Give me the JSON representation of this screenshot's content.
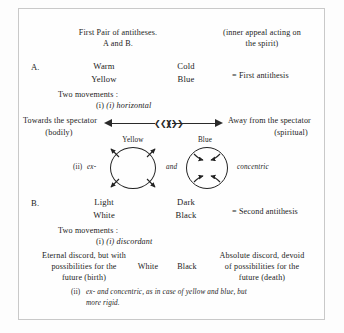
{
  "page": {
    "heading_line1": "First Pair of antitheses.",
    "heading_line2": "A and B.",
    "note_line1": "(inner appeal acting on",
    "note_line2": "the spirit)"
  },
  "section_a": {
    "label": "A.",
    "warm": "Warm",
    "yellow": "Yellow",
    "cold": "Cold",
    "blue": "Blue",
    "result": "= First antithesis",
    "two_movements": "Two movements :",
    "movement_i": "(i) horizontal",
    "towards_line1": "Towards the spectator",
    "towards_line2": "(bodily)",
    "away_line1": "Away from the spectator",
    "away_line2": "(spiritual)",
    "movement_ii_num": "(ii)",
    "movement_ii_ex": "ex-",
    "movement_ii_and": "and",
    "movement_ii_concentric": "concentric",
    "circle_left_label": "Yellow",
    "circle_right_label": "Blue"
  },
  "section_b": {
    "label": "B.",
    "light": "Light",
    "white": "White",
    "dark": "Dark",
    "black": "Black",
    "result": "= Second antithesis",
    "two_movements": "Two movements :",
    "movement_i": "(i) discordant",
    "left_line1": "Eternal discord, but with",
    "left_line2": "possibilities for the",
    "left_line3": "future (birth)",
    "mid_white": "White",
    "mid_black": "Black",
    "right_line1": "Absolute discord, devoid",
    "right_line2": "of possibilities for the",
    "right_line3": "future (death)",
    "movement_ii_num": "(ii)",
    "movement_ii_line1": "ex- and concentric, as in case of yellow and blue, but",
    "movement_ii_line2": "more rigid."
  },
  "colors": {
    "ink": "#1b1b1b",
    "rule": "#c9c9c9",
    "paper": "#fdfdfd"
  }
}
